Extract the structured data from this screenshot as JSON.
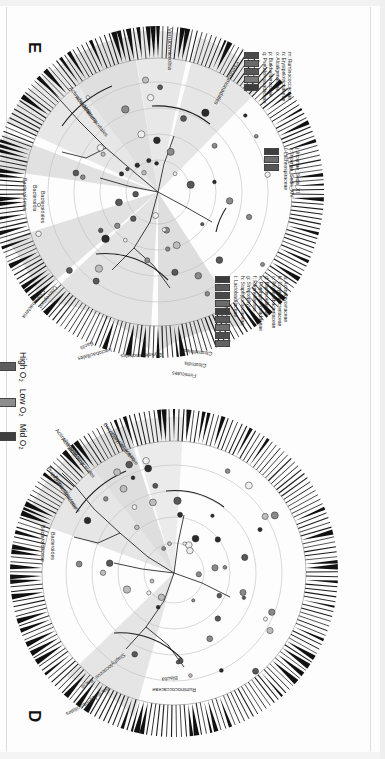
{
  "figure": {
    "type": "lefse-cladogram-pair",
    "orientation": "rotated-90-clockwise",
    "panels": [
      {
        "id": "E",
        "letter": "E",
        "taxa_labels": [
          "Verrucomicrobia",
          "Pseudomonadales",
          "Actinobacteria",
          "Actinobacteria",
          "Actinomycetales",
          "Bacteroidetes",
          "Bacteroidia",
          "Bacteroidales",
          "Cyanobacteria",
          "Chloroplast",
          "Bacilli",
          "Lactobacillales",
          "Erysipelotrichales",
          "Clostridiales",
          "Clostridia",
          "Firmicutes"
        ],
        "node_letters": [
          "a",
          "b",
          "c",
          "d",
          "e",
          "f",
          "g",
          "h",
          "i",
          "j",
          "k",
          "l",
          "m",
          "n",
          "o",
          "p",
          "q"
        ]
      },
      {
        "id": "D",
        "letter": "D",
        "taxa_labels": [
          "Actinobacteria",
          "Actinobacteria",
          "Actinomycetales",
          "Corynebacteriaceae",
          "Corynebacterium",
          "Propionibacteriaceae",
          "Propionibacterium",
          "Bacteroidaceae",
          "Bacteroides",
          "Staphylococcus",
          "Bacilli",
          "Bacillales",
          "Lactobacillales",
          "Blautia",
          "Ruminococcaceae"
        ],
        "node_letters": []
      }
    ]
  },
  "o2_legend": {
    "title": "",
    "items": [
      {
        "label": "High O₂",
        "color": "#5d5d5d"
      },
      {
        "label": "Low O₂",
        "color": "#8d8d8d"
      },
      {
        "label": "Mid O₂",
        "color": "#3f3f3f"
      }
    ]
  },
  "legend_top": {
    "entries": [
      {
        "key": "m",
        "name": "Ruminococcaceae"
      },
      {
        "key": "n",
        "name": "Erysipelotrichaceae"
      },
      {
        "key": "o",
        "name": "Alcaligenaceae"
      },
      {
        "key": "p",
        "name": "Burkholderiaceae"
      },
      {
        "key": "q",
        "name": "Pseudomonadaceae"
      }
    ],
    "swatch_colors": [
      "#4a4a4a",
      "#6a6a6a",
      "#585858",
      "#7a7a7a",
      "#3c3c3c"
    ]
  },
  "legend_middle": {
    "entries": [
      {
        "key": "j",
        "name": "Incertae_Sedis_XI"
      },
      {
        "key": "k",
        "name": "Incertae_Sedis_XIV"
      },
      {
        "key": "l",
        "name": "Lachnospiraceae"
      }
    ],
    "swatch_colors": [
      "#3f3f3f",
      "#6d6d6d",
      "#555555"
    ]
  },
  "legend_bottom": {
    "entries": [
      {
        "key": "a",
        "name": "Actinomycetaceae"
      },
      {
        "key": "b",
        "name": "Corynebacteriaceae"
      },
      {
        "key": "c",
        "name": "Propionibacteriaceae"
      },
      {
        "key": "d",
        "name": "Bacteroidaceae"
      },
      {
        "key": "e",
        "name": "Porphyromonadaceae"
      },
      {
        "key": "f",
        "name": "Rikenellaceae"
      },
      {
        "key": "g",
        "name": "Streptophyta"
      },
      {
        "key": "h",
        "name": "Staphylococcaceae"
      },
      {
        "key": "i",
        "name": "Lactobacillaceae"
      }
    ],
    "swatch_colors": [
      "#3b3b3b",
      "#5a5a5a",
      "#484848",
      "#6b6b6b",
      "#404040",
      "#585858",
      "#707070",
      "#4d4d4d",
      "#636363"
    ]
  },
  "chart_data": {
    "type": "cladogram",
    "title": "",
    "groups": [
      "High O₂",
      "Low O₂",
      "Mid O₂"
    ],
    "ranks": [
      "phylum",
      "class",
      "order",
      "family",
      "genus"
    ],
    "panel_E_highlighted": [
      {
        "taxon": "Verrucomicrobia",
        "rank": "phylum"
      },
      {
        "taxon": "Pseudomonadales",
        "rank": "order"
      },
      {
        "taxon": "Actinobacteria",
        "rank": "phylum"
      },
      {
        "taxon": "Actinobacteria",
        "rank": "class"
      },
      {
        "taxon": "Actinomycetales",
        "rank": "order"
      },
      {
        "taxon": "Bacteroidetes",
        "rank": "phylum"
      },
      {
        "taxon": "Bacteroidia",
        "rank": "class"
      },
      {
        "taxon": "Bacteroidales",
        "rank": "order"
      },
      {
        "taxon": "Cyanobacteria",
        "rank": "phylum"
      },
      {
        "taxon": "Chloroplast",
        "rank": "class"
      },
      {
        "taxon": "Bacilli",
        "rank": "class"
      },
      {
        "taxon": "Lactobacillales",
        "rank": "order"
      },
      {
        "taxon": "Erysipelotrichales",
        "rank": "order"
      },
      {
        "taxon": "Clostridiales",
        "rank": "order"
      },
      {
        "taxon": "Clostridia",
        "rank": "class"
      },
      {
        "taxon": "Firmicutes",
        "rank": "phylum"
      }
    ],
    "panel_D_highlighted": [
      {
        "taxon": "Actinobacteria",
        "rank": "phylum"
      },
      {
        "taxon": "Actinobacteria",
        "rank": "class"
      },
      {
        "taxon": "Actinomycetales",
        "rank": "order"
      },
      {
        "taxon": "Corynebacteriaceae",
        "rank": "family"
      },
      {
        "taxon": "Corynebacterium",
        "rank": "genus"
      },
      {
        "taxon": "Propionibacteriaceae",
        "rank": "family"
      },
      {
        "taxon": "Propionibacterium",
        "rank": "genus"
      },
      {
        "taxon": "Bacteroidaceae",
        "rank": "family"
      },
      {
        "taxon": "Bacteroides",
        "rank": "genus"
      },
      {
        "taxon": "Staphylococcus",
        "rank": "genus"
      },
      {
        "taxon": "Bacilli",
        "rank": "class"
      },
      {
        "taxon": "Bacillales",
        "rank": "order"
      },
      {
        "taxon": "Lactobacillales",
        "rank": "order"
      },
      {
        "taxon": "Blautia",
        "rank": "genus"
      },
      {
        "taxon": "Ruminococcaceae",
        "rank": "family"
      }
    ]
  }
}
